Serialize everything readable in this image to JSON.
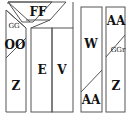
{
  "diagram": {
    "type": "bookshelf-layout",
    "stroke_color": "#555555",
    "labels": {
      "top": "FF",
      "left_top_small": "GG",
      "left_mid": "OO",
      "left_bottom": "Z",
      "center_left": "E",
      "center_right": "V",
      "right1_mid": "W",
      "right1_bottom": "AA",
      "right2_top": "AA",
      "right2_small": "GGr",
      "right2_bottom": "Z"
    }
  }
}
